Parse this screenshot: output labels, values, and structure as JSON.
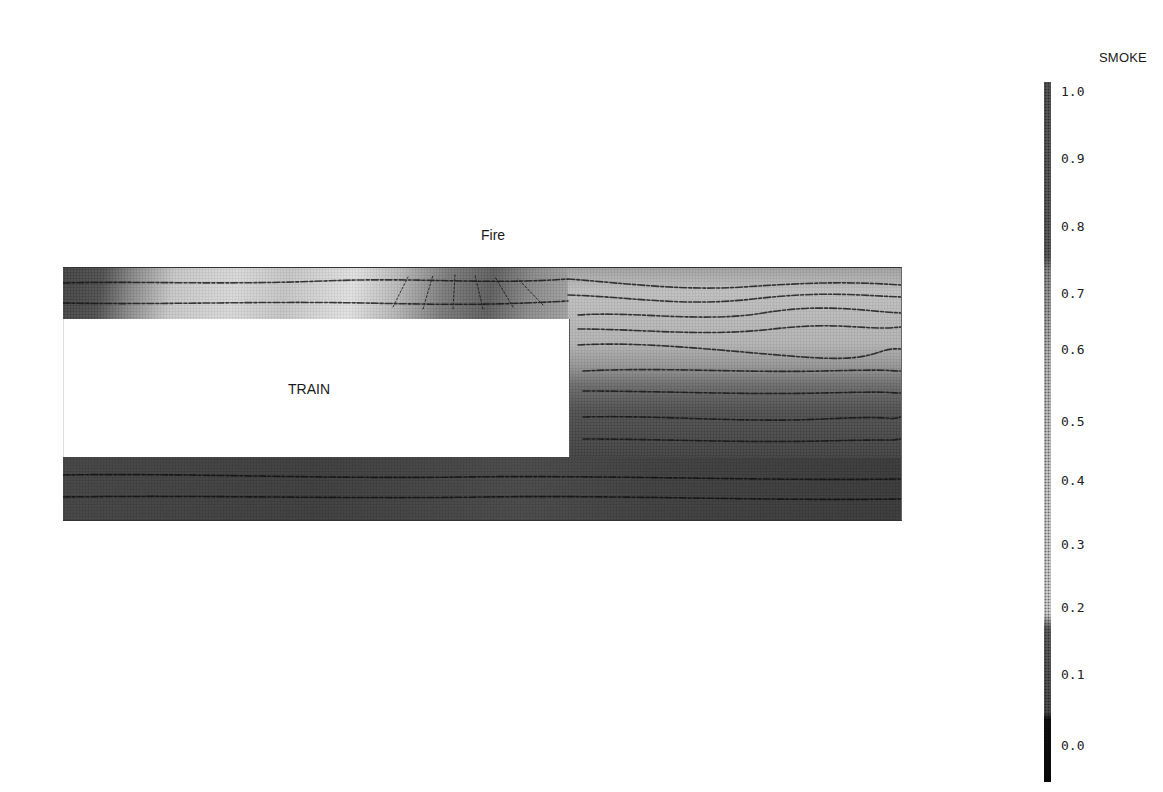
{
  "diagram": {
    "title_labels": {
      "fire": "Fire",
      "train": "TRAIN"
    },
    "domain": "tunnel cross-section with train and fire, smoke concentration contours with streamlines",
    "regions": [
      {
        "name": "upper-gap-over-train",
        "description": "narrow passage above train roof; smoke light near fire location, dark at upstream end"
      },
      {
        "name": "downstream-region",
        "description": "open tunnel beyond train end; light smoke aloft, darker smoke near floor"
      },
      {
        "name": "lower-gap-under-train",
        "description": "passage under train; dark smoke throughout"
      }
    ]
  },
  "legend": {
    "title": "SMOKE",
    "ticks": [
      "1.0",
      "0.9",
      "0.8",
      "0.7",
      "0.6",
      "0.5",
      "0.4",
      "0.3",
      "0.2",
      "0.1",
      "0.0"
    ],
    "colors": {
      "high": "#555555",
      "mid": "#c9c9c9",
      "low": "#0a0a0a"
    }
  }
}
